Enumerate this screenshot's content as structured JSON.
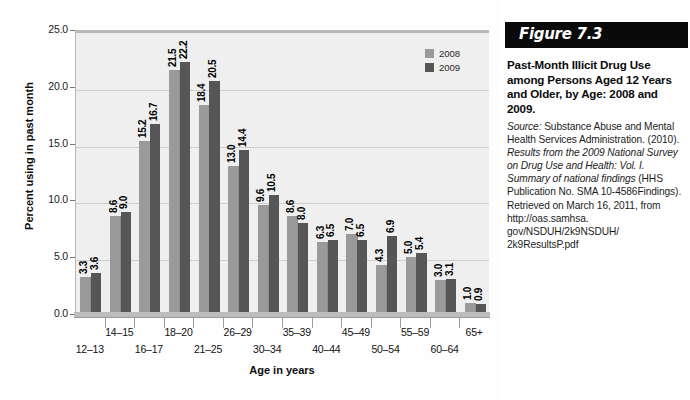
{
  "chart_data": {
    "type": "bar",
    "title": "Past-Month Illicit Drug Use among Persons Aged 12 Years and Older, by Age: 2008 and 2009.",
    "xlabel": "Age in years",
    "ylabel": "Percent using in past month",
    "ylim": [
      0,
      25
    ],
    "yticks": [
      "0.0",
      "5.0",
      "10.0",
      "15.0",
      "20.0",
      "25.0"
    ],
    "grid": true,
    "legend_position": "top-right",
    "categories": [
      "12–13",
      "14–15",
      "16–17",
      "18–20",
      "21–25",
      "26–29",
      "30–34",
      "35–39",
      "40–44",
      "45–49",
      "50–54",
      "55–59",
      "60–64",
      "65+"
    ],
    "series": [
      {
        "name": "2008",
        "color": "#9a9a9a",
        "values": [
          3.3,
          8.6,
          15.2,
          21.5,
          18.4,
          13.0,
          9.6,
          8.6,
          6.3,
          7.0,
          4.3,
          5.0,
          3.0,
          1.0
        ],
        "labels": [
          "3.3",
          "8.6",
          "15.2",
          "21.5",
          "18.4",
          "13.0",
          "9.6",
          "8.6",
          "6.3",
          "7.0",
          "4.3",
          "5.0",
          "3.0",
          "1.0"
        ]
      },
      {
        "name": "2009",
        "color": "#565656",
        "values": [
          3.6,
          9.0,
          16.7,
          22.2,
          20.5,
          14.4,
          10.5,
          8.0,
          6.5,
          6.5,
          6.9,
          5.4,
          3.1,
          0.9
        ],
        "labels": [
          "3.6",
          "9.0",
          "16.7",
          "22.2",
          "20.5",
          "14.4",
          "10.5",
          "8.0",
          "6.5",
          "6.5",
          "6.9",
          "5.4",
          "3.1",
          "0.9"
        ]
      }
    ]
  },
  "caption": {
    "figure_number": "Figure 7.3",
    "title": "Past-Month Illicit Drug Use among Persons Aged 12 Years and Older, by Age: 2008 and 2009.",
    "source_label": "Source:",
    "source_lines": [
      "Substance Abuse",
      "and Mental Health Services",
      "Administration. (2010). Results",
      "from the 2009 National Survey",
      "on Drug Use and Health:",
      "Vol. I. Summary of national",
      "findings (HHS Publication",
      "No. SMA 10-4586Findings).",
      "Retrieved on March 16, 2011,",
      "from http://oas.samhsa.",
      "gov/NSDUH/2k9NSDUH/",
      "2k9ResultsP.pdf"
    ]
  }
}
